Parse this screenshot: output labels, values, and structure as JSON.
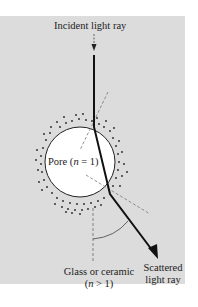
{
  "diagram": {
    "labels": {
      "incident": "Incident light ray",
      "pore_prefix": "Pore (",
      "pore_var": "n",
      "pore_suffix": " = 1)",
      "glass_line1": "Glass or ceramic",
      "glass_line2_prefix": "(",
      "glass_line2_var": "n",
      "glass_line2_suffix": " > 1)",
      "scattered_line1": "Scattered",
      "scattered_line2": "light ray"
    },
    "colors": {
      "panel": "#dcdcdc",
      "pore": "#ffffff",
      "ray": "#111111",
      "normal": "#777777"
    }
  }
}
